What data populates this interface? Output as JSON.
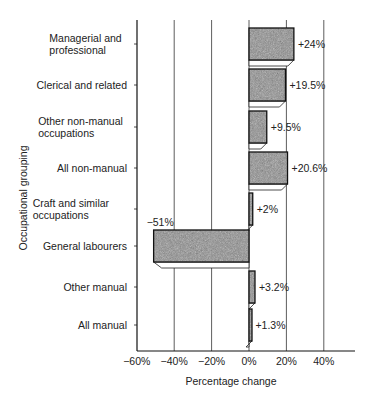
{
  "chart_data": {
    "type": "bar",
    "orientation": "horizontal",
    "title": "",
    "xlabel": "Percentage change",
    "ylabel": "Occupational grouping",
    "xlim": [
      -60,
      56
    ],
    "xticks": [
      -60,
      -40,
      -20,
      0,
      20,
      40
    ],
    "xtick_labels": [
      "−60%",
      "−40%",
      "−20%",
      "0%",
      "20%",
      "40%"
    ],
    "grid": "vertical",
    "legend": null,
    "categories": [
      [
        "Managerial and",
        "professional"
      ],
      [
        "Clerical and related"
      ],
      [
        "Other non-manual",
        "occupations"
      ],
      [
        "All non-manual"
      ],
      [
        "Craft and similar",
        "occupations"
      ],
      [
        "General labourers"
      ],
      [
        "Other manual"
      ],
      [
        "All manual"
      ]
    ],
    "values": [
      24,
      19.5,
      9.5,
      20.6,
      2,
      -51,
      3.2,
      1.3
    ],
    "value_labels": [
      "+24%",
      "+19.5%",
      "+9.5%",
      "+20.6%",
      "+2%",
      "−51%",
      "+3.2%",
      "+1.3%"
    ],
    "colors": {
      "bar_fill": "#8f8f8f",
      "bar_stroke": "#111111",
      "shadow": "#ffffff",
      "grid": "#333333"
    }
  }
}
